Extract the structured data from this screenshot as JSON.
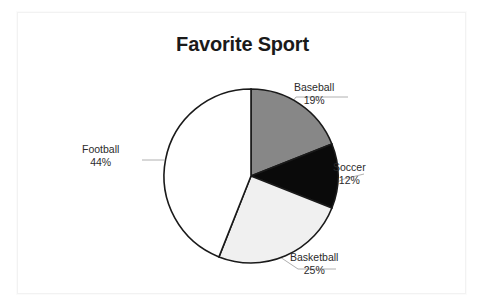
{
  "chart_data": {
    "type": "pie",
    "title": "Favorite Sport",
    "xlabel": "",
    "ylabel": "",
    "legend": "none",
    "grid": false,
    "start_angle_deg": 90,
    "direction": "clockwise",
    "categories": [
      "Baseball",
      "Soccer",
      "Basketball",
      "Football"
    ],
    "values": [
      19,
      12,
      25,
      44
    ],
    "value_suffix": "%",
    "total": 100,
    "slice_colors": [
      "#878787",
      "#0a0a0a",
      "#f0f0f0",
      "#ffffff"
    ],
    "slice_outline_color": "#1a1a1a",
    "leader_line_color": "#b0b0b0",
    "slices": [
      {
        "label": "Baseball",
        "value": 19,
        "value_text": "19%",
        "color": "#878787"
      },
      {
        "label": "Soccer",
        "value": 12,
        "value_text": "12%",
        "color": "#0a0a0a"
      },
      {
        "label": "Basketball",
        "value": 25,
        "value_text": "25%",
        "color": "#f0f0f0"
      },
      {
        "label": "Football",
        "value": 44,
        "value_text": "44%",
        "color": "#ffffff"
      }
    ]
  },
  "frame": {
    "border_color": "#f2f2f2",
    "background": "#ffffff"
  }
}
